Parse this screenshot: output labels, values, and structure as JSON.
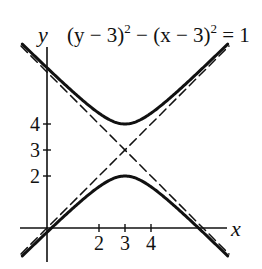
{
  "chart_data": {
    "type": "line",
    "title_parts": {
      "a": "(y − 3)",
      "sup1": "2",
      "b": " − (x − 3)",
      "sup2": "2",
      "c": " = 1"
    },
    "xlabel": "x",
    "ylabel": "y",
    "x_ticks": [
      2,
      3,
      4
    ],
    "y_ticks": [
      2,
      3,
      4
    ],
    "x_tick_labels": [
      "2",
      "3",
      "4"
    ],
    "y_tick_labels": [
      "2",
      "3",
      "4"
    ],
    "xlim": [
      -1,
      7
    ],
    "ylim": [
      -1,
      7
    ],
    "grid": false,
    "legend": null,
    "center": [
      3,
      3
    ],
    "vertices": [
      [
        3,
        4
      ],
      [
        3,
        2
      ]
    ],
    "series": [
      {
        "name": "upper branch",
        "equation": "y = 3 + sqrt(1 + (x-3)^2)",
        "style": "solid",
        "x": [
          -1,
          0,
          1,
          2,
          3,
          4,
          5,
          6,
          7
        ],
        "y": [
          7.12,
          6.16,
          5.24,
          4.41,
          4.0,
          4.41,
          5.24,
          6.16,
          7.12
        ]
      },
      {
        "name": "lower branch",
        "equation": "y = 3 - sqrt(1 + (x-3)^2)",
        "style": "solid",
        "x": [
          -1,
          0,
          1,
          2,
          3,
          4,
          5,
          6,
          7
        ],
        "y": [
          -1.12,
          -0.16,
          0.76,
          1.59,
          2.0,
          1.59,
          0.76,
          -0.16,
          -1.12
        ]
      },
      {
        "name": "asymptote y = x",
        "style": "dashed",
        "x": [
          -1,
          7
        ],
        "y": [
          -1,
          7
        ]
      },
      {
        "name": "asymptote y = 6 - x",
        "style": "dashed",
        "x": [
          -1,
          7
        ],
        "y": [
          7,
          -1
        ]
      }
    ]
  }
}
